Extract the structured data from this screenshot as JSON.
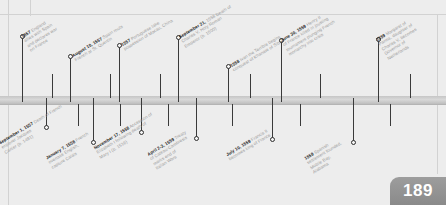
{
  "page": {
    "number": "189"
  },
  "timeline": {
    "axis_label": "timeline-bar",
    "marker_color": "#2e2e2e",
    "bar_color": "#c6c6c6",
    "date_color": "#1d1d1d",
    "text_color": "#9a9a9a"
  },
  "events_above": [
    {
      "date": "1557",
      "lines": [
        "England",
        "allies with Spain",
        "and declares war",
        "on France"
      ],
      "x": 22,
      "stem_top": 38
    },
    {
      "date": "August 10, 1557",
      "lines": [
        "Spain routs",
        "French at St. Quentin"
      ],
      "x": 70,
      "stem_top": 58
    },
    {
      "date": "1557",
      "lines": [
        "Portuguese take",
        "possession of Macau, China"
      ],
      "x": 119,
      "stem_top": 47
    },
    {
      "date": "September 21,",
      "lines": [
        "1558 Death of",
        "Charles V, Holy Roman",
        "Emperor (b. 1500)"
      ],
      "x": 178,
      "stem_top": 39
    },
    {
      "date": "1558",
      "lines": [
        "Ivan the Terrible begins",
        "conquest of Khanate of Sibir"
      ],
      "x": 228,
      "stem_top": 68
    },
    {
      "date": "June 30, 1559",
      "lines": [
        "Henry II",
        "of France killed in jousting",
        "tournament plunging French",
        "monarchy into crisis"
      ],
      "x": 281,
      "stem_top": 42
    },
    {
      "date": "1559",
      "lines": [
        "Margaret of",
        "Parma, daughter of",
        "Charles V, becomes",
        "Governor of",
        "Netherlands"
      ],
      "x": 378,
      "stem_top": 41
    }
  ],
  "events_below": [
    {
      "date": "September 1, 1557",
      "lines": [
        "Death of French",
        "explorer Jacques",
        "Cartier (b. 1491)"
      ],
      "x": 46,
      "stem_bottom": 126
    },
    {
      "date": "January 7, 1558",
      "lines": [
        "French",
        "overtake English,",
        "capture Calais"
      ],
      "x": 93,
      "stem_bottom": 141
    },
    {
      "date": "November 17, 1558",
      "lines": [
        "Accession of",
        "Elizabeth I following death of",
        "Mary I (b. 1516)"
      ],
      "x": 141,
      "stem_bottom": 131
    },
    {
      "date": "April 2-3, 1559",
      "lines": [
        "Treaty",
        "of Cateau-Cambresis",
        "marks end of",
        "Italian Wars"
      ],
      "x": 196,
      "stem_bottom": 137
    },
    {
      "date": "July 10, 1559",
      "lines": [
        "Francis II",
        "becomes king of France"
      ],
      "x": 272,
      "stem_bottom": 138
    },
    {
      "date": "1559",
      "lines": [
        "Spanish",
        "settlement founded,",
        "Mobile Bay,",
        "Alabama"
      ],
      "x": 353,
      "stem_bottom": 141
    }
  ],
  "extra_ticks_above": [
    52,
    110,
    160,
    250,
    320,
    410
  ],
  "extra_ticks_below": [
    78,
    120,
    168,
    232,
    300,
    390
  ]
}
